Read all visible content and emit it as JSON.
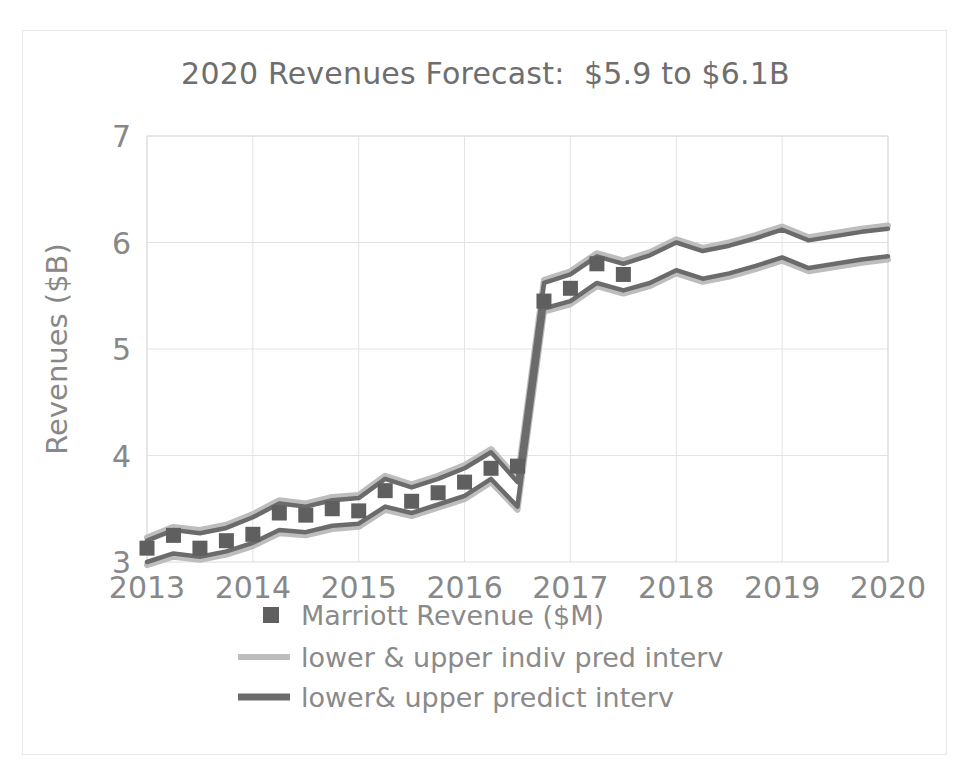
{
  "chart_data": {
    "type": "line",
    "title": "2020 Revenues Forecast:  $5.9 to $6.1B",
    "xlabel": "",
    "ylabel": "Revenues ($B)",
    "xlim": [
      2013.0,
      2020.0
    ],
    "ylim": [
      3,
      7
    ],
    "yticks": [
      3,
      4,
      5,
      6,
      7
    ],
    "xticks": [
      "2013",
      "2014",
      "2015",
      "2016",
      "2017",
      "2018",
      "2019",
      "2020"
    ],
    "grid": true,
    "legend_position": "bottom",
    "colors": {
      "marker": "#5f5f5f",
      "indiv_pred_interval": "#bdbdbd",
      "predict_interval": "#6b6b6b",
      "grid": "#e3e3e3",
      "text": "#888888",
      "frame": "#e8e8e8"
    },
    "legend": [
      {
        "label": "Marriott Revenue ($M)",
        "marker": "square",
        "color": "#5f5f5f"
      },
      {
        "label": "lower & upper indiv pred interv",
        "marker": "line",
        "color": "#bdbdbd"
      },
      {
        "label": "lower& upper predict interv",
        "marker": "line",
        "color": "#6b6b6b"
      }
    ],
    "x": [
      2013.0,
      2013.25,
      2013.5,
      2013.75,
      2014.0,
      2014.25,
      2014.5,
      2014.75,
      2015.0,
      2015.25,
      2015.5,
      2015.75,
      2016.0,
      2016.25,
      2016.5,
      2016.75,
      2017.0,
      2017.25,
      2017.5
    ],
    "series": [
      {
        "name": "Marriott Revenue ($M)",
        "type": "scatter",
        "values": [
          3.13,
          3.25,
          3.13,
          3.2,
          3.26,
          3.46,
          3.44,
          3.5,
          3.48,
          3.67,
          3.57,
          3.65,
          3.75,
          3.88,
          3.9,
          5.45,
          5.57,
          5.8,
          5.7
        ]
      },
      {
        "name": "upper predict interv",
        "type": "line",
        "x": [
          2013.0,
          2013.25,
          2013.5,
          2013.75,
          2014.0,
          2014.25,
          2014.5,
          2014.75,
          2015.0,
          2015.25,
          2015.5,
          2015.75,
          2016.0,
          2016.25,
          2016.5,
          2016.75,
          2017.0,
          2017.25,
          2017.5,
          2017.75,
          2018.0,
          2018.25,
          2018.5,
          2018.75,
          2019.0,
          2019.25,
          2019.5,
          2019.75,
          2020.0
        ],
        "values": [
          3.2,
          3.3,
          3.27,
          3.32,
          3.42,
          3.55,
          3.52,
          3.58,
          3.6,
          3.78,
          3.7,
          3.78,
          3.88,
          4.03,
          3.75,
          5.62,
          5.7,
          5.87,
          5.8,
          5.88,
          6.0,
          5.92,
          5.97,
          6.04,
          6.12,
          6.02,
          6.06,
          6.1,
          6.13
        ]
      },
      {
        "name": "lower predict interv",
        "type": "line",
        "x": [
          2013.0,
          2013.25,
          2013.5,
          2013.75,
          2014.0,
          2014.25,
          2014.5,
          2014.75,
          2015.0,
          2015.25,
          2015.5,
          2015.75,
          2016.0,
          2016.25,
          2016.5,
          2016.75,
          2017.0,
          2017.25,
          2017.5,
          2017.75,
          2018.0,
          2018.25,
          2018.5,
          2018.75,
          2019.0,
          2019.25,
          2019.5,
          2019.75,
          2020.0
        ],
        "values": [
          3.0,
          3.08,
          3.05,
          3.1,
          3.18,
          3.3,
          3.28,
          3.34,
          3.36,
          3.52,
          3.46,
          3.54,
          3.62,
          3.78,
          3.52,
          5.38,
          5.45,
          5.62,
          5.55,
          5.62,
          5.74,
          5.66,
          5.71,
          5.78,
          5.86,
          5.76,
          5.8,
          5.84,
          5.87
        ]
      },
      {
        "name": "upper indiv pred interv",
        "type": "line",
        "x": [
          2013.0,
          2013.25,
          2013.5,
          2013.75,
          2014.0,
          2014.25,
          2014.5,
          2014.75,
          2015.0,
          2015.25,
          2015.5,
          2015.75,
          2016.0,
          2016.25,
          2016.5,
          2016.75,
          2017.0,
          2017.25,
          2017.5,
          2017.75,
          2018.0,
          2018.25,
          2018.5,
          2018.75,
          2019.0,
          2019.25,
          2019.5,
          2019.75,
          2020.0
        ],
        "values": [
          3.23,
          3.33,
          3.3,
          3.35,
          3.45,
          3.58,
          3.55,
          3.61,
          3.63,
          3.81,
          3.73,
          3.81,
          3.91,
          4.06,
          3.78,
          5.65,
          5.73,
          5.9,
          5.83,
          5.91,
          6.03,
          5.95,
          6.0,
          6.07,
          6.15,
          6.05,
          6.09,
          6.13,
          6.16
        ]
      },
      {
        "name": "lower indiv pred interv",
        "type": "line",
        "x": [
          2013.0,
          2013.25,
          2013.5,
          2013.75,
          2014.0,
          2014.25,
          2014.5,
          2014.75,
          2015.0,
          2015.25,
          2015.5,
          2015.75,
          2016.0,
          2016.25,
          2016.5,
          2016.75,
          2017.0,
          2017.25,
          2017.5,
          2017.75,
          2018.0,
          2018.25,
          2018.5,
          2018.75,
          2019.0,
          2019.25,
          2019.5,
          2019.75,
          2020.0
        ],
        "values": [
          2.97,
          3.05,
          3.02,
          3.07,
          3.15,
          3.27,
          3.25,
          3.31,
          3.33,
          3.49,
          3.43,
          3.51,
          3.59,
          3.75,
          3.49,
          5.35,
          5.42,
          5.59,
          5.52,
          5.59,
          5.71,
          5.63,
          5.68,
          5.75,
          5.83,
          5.73,
          5.77,
          5.81,
          5.84
        ]
      }
    ]
  },
  "plot_geometry": {
    "left": 124,
    "top": 105,
    "right": 865,
    "bottom": 531
  }
}
